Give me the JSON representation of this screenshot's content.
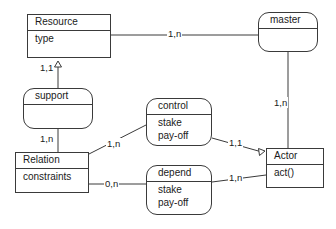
{
  "diagram": {
    "stroke_color": "#3a3a3a",
    "text_color": "#1a1a1a",
    "background": "#ffffff",
    "nodes": [
      {
        "id": "resource",
        "name": "Resource",
        "shape": "rectangle",
        "attributes": [
          "type"
        ],
        "x": 27,
        "y": 14,
        "width": 84,
        "height": 44
      },
      {
        "id": "master",
        "name": "master",
        "shape": "rounded",
        "attributes": [],
        "x": 258,
        "y": 12,
        "width": 60,
        "height": 40
      },
      {
        "id": "support",
        "name": "support",
        "shape": "rounded",
        "attributes": [],
        "x": 23,
        "y": 88,
        "width": 70,
        "height": 41
      },
      {
        "id": "control",
        "name": "control",
        "shape": "rounded",
        "attributes": [
          "stake",
          "pay-off"
        ],
        "x": 146,
        "y": 98,
        "width": 66,
        "height": 48
      },
      {
        "id": "relation",
        "name": "Relation",
        "shape": "rectangle",
        "attributes": [
          "constraints"
        ],
        "x": 15,
        "y": 152,
        "width": 74,
        "height": 41
      },
      {
        "id": "depend",
        "name": "depend",
        "shape": "rounded",
        "attributes": [
          "stake",
          "pay-off"
        ],
        "x": 146,
        "y": 165,
        "width": 66,
        "height": 50
      },
      {
        "id": "actor",
        "name": "Actor",
        "shape": "rectangle",
        "attributes": [
          "act()"
        ],
        "x": 266,
        "y": 148,
        "width": 58,
        "height": 40
      }
    ],
    "edges": [
      {
        "id": "resource-master",
        "from": "resource",
        "to": "master",
        "label": "1,n",
        "arrow": "none"
      },
      {
        "id": "resource-support",
        "from": "support",
        "to": "resource",
        "label": "1,1",
        "arrow": "triangle"
      },
      {
        "id": "support-relation",
        "from": "support",
        "to": "relation",
        "label": "1,n",
        "arrow": "none"
      },
      {
        "id": "relation-control",
        "from": "relation",
        "to": "control",
        "label": "1,n",
        "arrow": "none"
      },
      {
        "id": "control-actor",
        "from": "control",
        "to": "actor",
        "label": "1,1",
        "arrow": "triangle"
      },
      {
        "id": "relation-depend",
        "from": "relation",
        "to": "depend",
        "label": "0,n",
        "arrow": "none"
      },
      {
        "id": "depend-actor",
        "from": "depend",
        "to": "actor",
        "label": "1,n",
        "arrow": "none"
      },
      {
        "id": "master-actor",
        "from": "master",
        "to": "actor",
        "label": "1,n",
        "arrow": "none"
      }
    ],
    "labels": {
      "resource_master": "1,n",
      "resource_support": "1,1",
      "support_relation": "1,n",
      "relation_control": "1,n",
      "control_actor": "1,1",
      "relation_depend": "0,n",
      "depend_actor": "1,n",
      "master_actor": "1,n"
    }
  }
}
